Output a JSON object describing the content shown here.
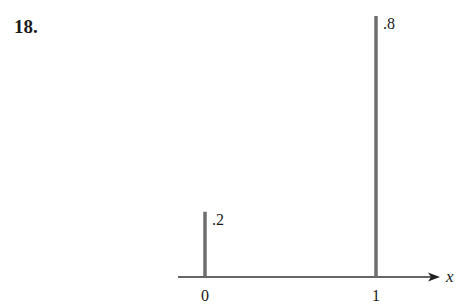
{
  "problem": {
    "number": "18."
  },
  "chart_data": {
    "type": "bar",
    "subtype": "probability-mass-function-spikes",
    "title": "",
    "xlabel": "x",
    "ylabel": "",
    "categories": [
      "0",
      "1"
    ],
    "x": [
      0,
      1
    ],
    "values": [
      0.2,
      0.8
    ],
    "value_labels": [
      ".2",
      ".8"
    ],
    "x_tick_labels": [
      "0",
      "1"
    ],
    "ylim": [
      0,
      0.8
    ],
    "grid": false,
    "legend": null,
    "colors": {
      "bar": "#6e6e6e",
      "axis": "#333333",
      "text": "#1a1a1a"
    }
  }
}
